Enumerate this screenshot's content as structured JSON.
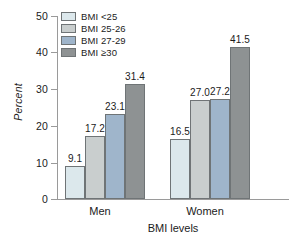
{
  "chart_data": {
    "type": "bar",
    "title": "",
    "xlabel": "BMI levels",
    "ylabel": "Percent",
    "categories": [
      "Men",
      "Women"
    ],
    "ylim": [
      0,
      50
    ],
    "yticks": [
      0,
      10,
      20,
      30,
      40,
      50
    ],
    "ytick_labels": [
      "0",
      "10",
      "20",
      "30",
      "40",
      "50"
    ],
    "grid": false,
    "legend_position": "top-left",
    "series": [
      {
        "name": "BMI <25",
        "color": "#dce8ec",
        "values": [
          9.1,
          16.5
        ],
        "labels": [
          "9.1",
          "16.5"
        ]
      },
      {
        "name": "BMI 25-26",
        "color": "#c9cece",
        "values": [
          17.2,
          27.0
        ],
        "labels": [
          "17.2",
          "27.0"
        ]
      },
      {
        "name": "BMI 27-29",
        "color": "#9fb5cb",
        "values": [
          23.1,
          27.2
        ],
        "labels": [
          "23.1",
          "27.2"
        ]
      },
      {
        "name": "BMI ≥30",
        "color": "#8e9293",
        "values": [
          31.4,
          41.5
        ],
        "labels": [
          "31.4",
          "41.5"
        ]
      }
    ],
    "axis_color": "#9a9a9a",
    "bar_edge_color": "#6f7476",
    "text_color": "#1b1b1b",
    "background": "#ffffff"
  },
  "legend": {
    "items": [
      {
        "label": "BMI <25"
      },
      {
        "label": "BMI 25-26"
      },
      {
        "label": "BMI 27-29"
      },
      {
        "label": "BMI ≥30"
      }
    ]
  },
  "axes": {
    "y_title": "Percent",
    "x_title": "BMI levels",
    "y_labels": [
      "50",
      "40",
      "30",
      "20",
      "10",
      "0"
    ],
    "x_labels": [
      "Men",
      "Women"
    ]
  }
}
